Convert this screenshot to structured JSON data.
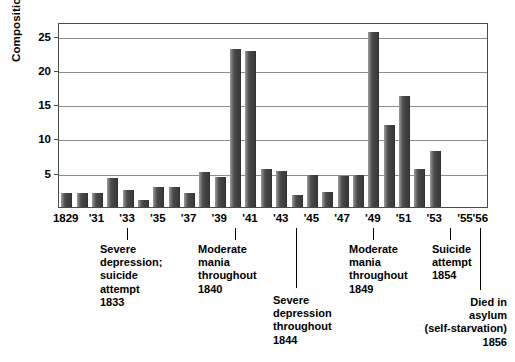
{
  "chart_data": {
    "type": "bar",
    "title": "",
    "xlabel": "",
    "ylabel": "Compositions",
    "ylim": [
      0,
      27
    ],
    "yticks": [
      5,
      10,
      15,
      20,
      25
    ],
    "grid": true,
    "legend": "none",
    "categories": [
      "1829",
      "1830",
      "1831",
      "1832",
      "1833",
      "1834",
      "1835",
      "1836",
      "1837",
      "1838",
      "1839",
      "1840",
      "1841",
      "1842",
      "1843",
      "1844",
      "1845",
      "1846",
      "1847",
      "1848",
      "1849",
      "1850",
      "1851",
      "1852",
      "1853",
      "1854",
      "1855",
      "1856"
    ],
    "tick_labels": [
      "1829",
      "",
      "'31",
      "",
      "'33",
      "",
      "'35",
      "",
      "'37",
      "",
      "'39",
      "",
      "'41",
      "",
      "'43",
      "",
      "'45",
      "",
      "'47",
      "",
      "'49",
      "",
      "'51",
      "",
      "'53",
      "",
      "'55",
      "'56"
    ],
    "values": [
      2,
      2,
      2,
      4.2,
      2.5,
      1,
      2.9,
      2.9,
      2.1,
      5.1,
      4.4,
      23,
      22.8,
      5.6,
      5.3,
      1.8,
      4.6,
      2.2,
      4.5,
      4.7,
      25.5,
      12,
      16.2,
      5.5,
      8.2,
      0,
      0,
      0
    ]
  },
  "axis": {
    "y_title": "Compositions",
    "y_tick_labels": [
      "25",
      "20",
      "15",
      "10",
      "5"
    ]
  },
  "annotations": [
    {
      "id": "severe-depression-1833",
      "text": "Severe\ndepression;\nsuicide\nattempt\n1833",
      "anchor_label": "'33",
      "align": "left"
    },
    {
      "id": "moderate-mania-1840",
      "text": "Moderate\nmania\nthroughout\n1840",
      "anchor_label": "'40",
      "align": "left"
    },
    {
      "id": "severe-depression-1844",
      "text": "Severe\ndepression\nthroughout\n1844",
      "anchor_label": "'44",
      "align": "left"
    },
    {
      "id": "moderate-mania-1849",
      "text": "Moderate\nmania\nthroughout\n1849",
      "anchor_label": "'49",
      "align": "left"
    },
    {
      "id": "suicide-attempt-1854",
      "text": "Suicide\nattempt\n1854",
      "anchor_label": "'54",
      "align": "left"
    },
    {
      "id": "died-in-asylum-1856",
      "text": "Died in\nasylum\n(self-starvation)\n1856",
      "anchor_label": "'56",
      "align": "right"
    }
  ],
  "colors": {
    "bar_light": "#9a9a9a",
    "bar_dark": "#2b2b2b",
    "gridline": "#8d8d8d",
    "frame": "#4a4a4a",
    "text": "#000000",
    "background": "#ffffff"
  }
}
